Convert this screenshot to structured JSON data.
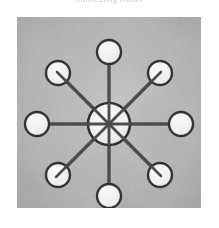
{
  "figure": {
    "caption": "connecting model",
    "kind": "scanned-photograph",
    "colors": {
      "page_background": "#ffffff",
      "photo_background_light": "#c3c3c3",
      "photo_background_mid": "#b2b2b2",
      "photo_background_dark": "#a2a2a2",
      "node_fill": "#f2f2f2",
      "node_stroke": "#2f2f2f",
      "spoke": "#4a4a4a",
      "caption_text": "#9a9a9a"
    },
    "plate": {
      "x": 17,
      "y": 17,
      "width": 184,
      "height": 191
    }
  },
  "diagram_data": {
    "type": "node-link",
    "topology": "star",
    "hub": {
      "label": "hub",
      "cx": 92,
      "cy": 107,
      "r": 21,
      "fill": "#f2f2f2",
      "stroke": "#2f2f2f"
    },
    "spoke_count": 8,
    "node_radius": 12,
    "orbit_radius": 72,
    "nodes": [
      {
        "label": "node-n",
        "angle_deg": 270,
        "cx": 92,
        "cy": 35,
        "r": 12
      },
      {
        "label": "node-ne",
        "angle_deg": 315,
        "cx": 143,
        "cy": 56,
        "r": 12
      },
      {
        "label": "node-e",
        "angle_deg": 0,
        "cx": 164,
        "cy": 107,
        "r": 12
      },
      {
        "label": "node-se",
        "angle_deg": 45,
        "cx": 143,
        "cy": 158,
        "r": 12
      },
      {
        "label": "node-s",
        "angle_deg": 90,
        "cx": 92,
        "cy": 179,
        "r": 12
      },
      {
        "label": "node-sw",
        "angle_deg": 135,
        "cx": 41,
        "cy": 158,
        "r": 12
      },
      {
        "label": "node-w",
        "angle_deg": 180,
        "cx": 20,
        "cy": 107,
        "r": 12
      },
      {
        "label": "node-nw",
        "angle_deg": 225,
        "cx": 41,
        "cy": 56,
        "r": 12
      }
    ],
    "links": [
      {
        "label": "link-hub-n",
        "from": "hub",
        "to": "node-n"
      },
      {
        "label": "link-hub-ne",
        "from": "hub",
        "to": "node-ne"
      },
      {
        "label": "link-hub-e",
        "from": "hub",
        "to": "node-e"
      },
      {
        "label": "link-hub-se",
        "from": "hub",
        "to": "node-se"
      },
      {
        "label": "link-hub-s",
        "from": "hub",
        "to": "node-s"
      },
      {
        "label": "link-hub-sw",
        "from": "hub",
        "to": "node-sw"
      },
      {
        "label": "link-hub-w",
        "from": "hub",
        "to": "node-w"
      },
      {
        "label": "link-hub-nw",
        "from": "hub",
        "to": "node-nw"
      }
    ]
  }
}
